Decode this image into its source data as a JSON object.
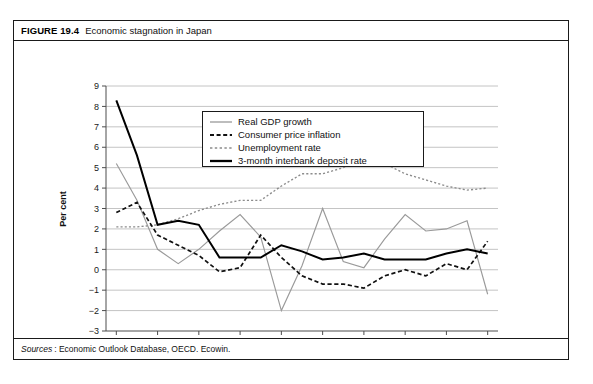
{
  "figure": {
    "number": "FIGURE 19.4",
    "title": "Economic stagnation in Japan",
    "source_label": "Sources",
    "source_text": ": Economic Outlook Database, OECD. Ecowin."
  },
  "legend": {
    "items": [
      {
        "label": "Real GDP growth",
        "style": "solid-gray",
        "color": "#9a9a9a"
      },
      {
        "label": "Consumer price inflation",
        "style": "dashed-black",
        "color": "#111111"
      },
      {
        "label": "Unemployment rate",
        "style": "dotted-gray",
        "color": "#8c8c8c"
      },
      {
        "label": "3-month interbank deposit rate",
        "style": "solid-black-bold",
        "color": "#000000"
      }
    ]
  },
  "chart_data": {
    "type": "line",
    "title": "Economic stagnation in Japan",
    "xlabel": "",
    "ylabel": "Per cent",
    "xlim": [
      1989.5,
      2008.5
    ],
    "ylim": [
      -3,
      9
    ],
    "ytick_labels": [
      "9",
      "8",
      "7",
      "6",
      "5",
      "4",
      "3",
      "2",
      "1",
      "0",
      "-1",
      "-2",
      "-3"
    ],
    "ytick_values": [
      9,
      8,
      7,
      6,
      5,
      4,
      3,
      2,
      1,
      0,
      -1,
      -2,
      -3
    ],
    "xtick_labels": [
      "1990",
      "1992",
      "1994",
      "1996",
      "1998",
      "2000",
      "2002",
      "2004",
      "2006",
      "2008"
    ],
    "xtick_values": [
      1990,
      1992,
      1994,
      1996,
      1998,
      2000,
      2002,
      2004,
      2006,
      2008
    ],
    "grid": "horizontal",
    "legend_position": "upper-center",
    "x": [
      1990,
      1991,
      1992,
      1993,
      1994,
      1995,
      1996,
      1997,
      1998,
      1999,
      2000,
      2001,
      2002,
      2003,
      2004,
      2005,
      2006,
      2007,
      2008
    ],
    "series": [
      {
        "name": "Real GDP growth",
        "color": "#9a9a9a",
        "values": [
          5.2,
          3.4,
          1.0,
          0.3,
          1.0,
          1.9,
          2.7,
          1.6,
          -2.0,
          0.2,
          3.0,
          0.4,
          0.1,
          1.5,
          2.7,
          1.9,
          2.0,
          2.4,
          -1.2
        ]
      },
      {
        "name": "Consumer price inflation",
        "color": "#111111",
        "values": [
          2.8,
          3.3,
          1.7,
          1.2,
          0.7,
          -0.1,
          0.1,
          1.7,
          0.6,
          -0.3,
          -0.7,
          -0.7,
          -0.9,
          -0.3,
          0.0,
          -0.3,
          0.3,
          0.0,
          1.4
        ]
      },
      {
        "name": "Unemployment rate",
        "color": "#8c8c8c",
        "values": [
          2.1,
          2.1,
          2.2,
          2.5,
          2.9,
          3.2,
          3.4,
          3.4,
          4.1,
          4.7,
          4.7,
          5.0,
          5.4,
          5.2,
          4.7,
          4.4,
          4.1,
          3.9,
          4.0
        ]
      },
      {
        "name": "3-month interbank deposit rate",
        "color": "#000000",
        "values": [
          8.3,
          5.6,
          2.2,
          2.4,
          2.2,
          0.6,
          0.6,
          0.6,
          1.2,
          0.9,
          0.5,
          0.6,
          0.8,
          0.5,
          0.5,
          0.5,
          0.8,
          1.0,
          0.8
        ]
      }
    ]
  }
}
